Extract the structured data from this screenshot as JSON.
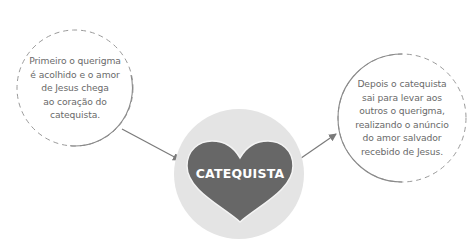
{
  "diagram": {
    "left_bubble": {
      "lines": [
        "Primeiro o querigma",
        "é acolhido e o amor",
        "de Jesus chega",
        "ao coração do",
        "catequista."
      ]
    },
    "center": {
      "label": "CATEQUISTA",
      "heart_color": "#666666",
      "circle_color": "#e3e3e3"
    },
    "right_bubble": {
      "lines": [
        "Depois o catequista",
        "sai para levar aos",
        "outros o querigma,",
        "realizando o anúncio",
        "do amor salvador",
        "recebido de Jesus."
      ]
    },
    "colors": {
      "outline": "#8a8a8a",
      "text": "#6a6a6a",
      "arrow": "#7a7a7a"
    }
  }
}
